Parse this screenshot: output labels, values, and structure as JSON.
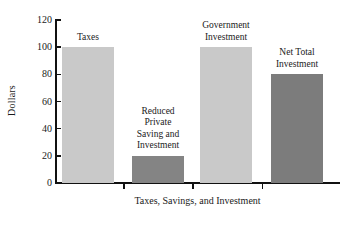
{
  "chart_data": {
    "type": "bar",
    "title": "",
    "xlabel": "Taxes, Savings, and Investment",
    "ylabel": "Dollars",
    "ylim": [
      0,
      120
    ],
    "yticks": [
      0,
      20,
      40,
      60,
      80,
      100,
      120
    ],
    "ytick_labels": [
      "0",
      "20",
      "40",
      "60",
      "80",
      "100",
      "120"
    ],
    "grid": false,
    "legend": "none",
    "categories": [
      "Taxes",
      "Reduced Private Saving and Investment",
      "Government Investment",
      "Net Total Investment"
    ],
    "values": [
      100,
      20,
      100,
      80
    ],
    "bar_labels": [
      "Taxes",
      "Reduced\nPrivate\nSaving and\nInvestment",
      "Government\nInvestment",
      "Net Total\nInvestment"
    ],
    "colors": [
      "#c9c9c9",
      "#848484",
      "#c9c9c9",
      "#7c7c7c"
    ],
    "axis_color": "#111111"
  }
}
